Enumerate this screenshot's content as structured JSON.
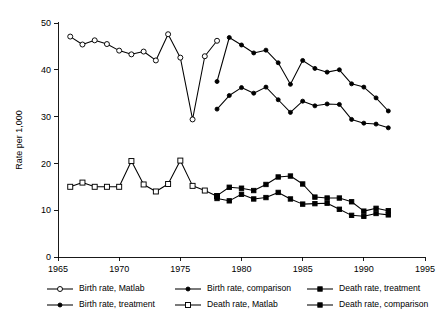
{
  "chart_data": {
    "type": "line",
    "title": "",
    "xlabel": "",
    "ylabel": "Rate per 1,000",
    "xlim": [
      1965,
      1995
    ],
    "ylim": [
      0,
      50
    ],
    "xticks": [
      1965,
      1970,
      1975,
      1980,
      1985,
      1990,
      1995
    ],
    "yticks": [
      0,
      10,
      20,
      30,
      40,
      50
    ],
    "grid": false,
    "legend_position": "bottom",
    "legend_columns": 3,
    "series": [
      {
        "name": "Birth rate, Matlab",
        "marker": "open-circle",
        "x": [
          1966,
          1967,
          1968,
          1969,
          1970,
          1971,
          1972,
          1973,
          1974,
          1975,
          1976,
          1977,
          1978
        ],
        "values": [
          47.1,
          45.4,
          46.3,
          45.5,
          44.1,
          43.3,
          43.9,
          42.0,
          47.6,
          42.6,
          29.4,
          42.9,
          46.2
        ]
      },
      {
        "name": "Death rate, Matlab",
        "marker": "open-square",
        "x": [
          1966,
          1967,
          1968,
          1969,
          1970,
          1971,
          1972,
          1973,
          1974,
          1975,
          1976,
          1977,
          1978
        ],
        "values": [
          15.0,
          15.9,
          15.0,
          15.0,
          15.0,
          20.5,
          15.5,
          14.0,
          15.6,
          20.6,
          15.2,
          14.2,
          13.0
        ]
      },
      {
        "name": "Birth rate, comparison",
        "marker": "filled-circle",
        "x": [
          1978,
          1979,
          1980,
          1981,
          1982,
          1983,
          1984,
          1985,
          1986,
          1987,
          1988,
          1989,
          1990,
          1991,
          1992
        ],
        "values": [
          37.5,
          46.9,
          45.3,
          43.6,
          44.2,
          41.5,
          36.9,
          42.0,
          40.3,
          39.5,
          40.0,
          37.0,
          36.3,
          34.0,
          31.2
        ]
      },
      {
        "name": "Birth rate, treatment",
        "marker": "filled-circle",
        "x": [
          1978,
          1979,
          1980,
          1981,
          1982,
          1983,
          1984,
          1985,
          1986,
          1987,
          1988,
          1989,
          1990,
          1991,
          1992
        ],
        "values": [
          31.6,
          34.5,
          36.2,
          35.0,
          36.3,
          33.6,
          30.9,
          33.3,
          32.3,
          32.7,
          32.6,
          29.4,
          28.6,
          28.4,
          27.6
        ]
      },
      {
        "name": "Death rate, treatment",
        "marker": "filled-square",
        "x": [
          1978,
          1979,
          1980,
          1981,
          1982,
          1983,
          1984,
          1985,
          1986,
          1987,
          1988,
          1989,
          1990,
          1991,
          1992
        ],
        "values": [
          13.1,
          14.9,
          14.7,
          14.2,
          15.5,
          17.1,
          17.3,
          15.6,
          12.8,
          12.6,
          12.6,
          11.8,
          9.8,
          10.4,
          9.9
        ]
      },
      {
        "name": "Death rate, comparison",
        "marker": "filled-square",
        "x": [
          1978,
          1979,
          1980,
          1981,
          1982,
          1983,
          1984,
          1985,
          1986,
          1987,
          1988,
          1989,
          1990,
          1991,
          1992
        ],
        "values": [
          12.5,
          12.0,
          13.4,
          12.4,
          12.7,
          13.8,
          12.4,
          11.3,
          11.4,
          11.5,
          10.2,
          8.9,
          8.7,
          9.3,
          9.0
        ]
      }
    ],
    "legend": [
      {
        "label": "Birth rate, Matlab",
        "marker": "open-circle",
        "row": 0,
        "col": 0
      },
      {
        "label": "Birth rate, comparison",
        "marker": "filled-circle",
        "row": 0,
        "col": 1
      },
      {
        "label": "Death rate, treatment",
        "marker": "filled-square",
        "row": 0,
        "col": 2
      },
      {
        "label": "Birth rate, treatment",
        "marker": "filled-circle",
        "row": 1,
        "col": 0
      },
      {
        "label": "Death rate, Matlab",
        "marker": "open-square",
        "row": 1,
        "col": 1
      },
      {
        "label": "Death rate, comparison",
        "marker": "filled-square",
        "row": 1,
        "col": 2
      }
    ],
    "colors": {
      "line": "#000000",
      "marker_fill_open": "#ffffff",
      "marker_fill_solid": "#000000",
      "background": "#ffffff"
    }
  }
}
